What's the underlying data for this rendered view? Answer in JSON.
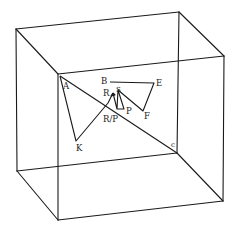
{
  "diagram": {
    "type": "3d-cube-trajectory",
    "colors": {
      "line": "#1a1a1a",
      "background": "#ffffff"
    },
    "cube": {
      "back_face": [
        [
          16,
          29
        ],
        [
          179,
          12
        ],
        [
          177,
          153
        ],
        [
          17,
          171
        ]
      ],
      "front_face": [
        [
          58,
          74
        ],
        [
          224,
          56
        ],
        [
          223,
          201
        ],
        [
          58,
          220
        ]
      ]
    },
    "labels": {
      "A": "A",
      "B": "B",
      "E": "E",
      "R": "R",
      "S": "S",
      "P": "P",
      "RP": "R/P",
      "F": "F",
      "K": "K",
      "C": "c"
    }
  }
}
